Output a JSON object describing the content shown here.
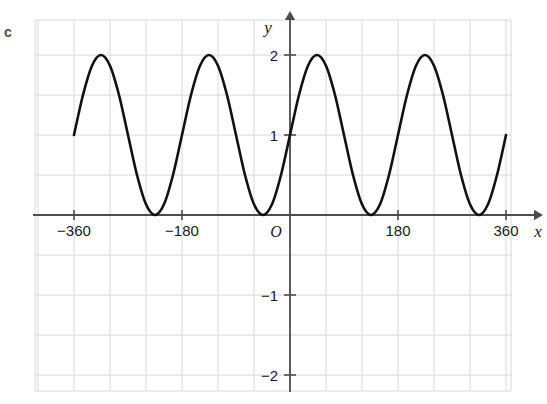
{
  "part_label": "c",
  "chart_data": {
    "type": "line",
    "title": "",
    "subtitle": "",
    "xlabel": "x",
    "ylabel": "y",
    "origin_label": "O",
    "equation": "y = 1 + sin(2x)",
    "grid": true,
    "legend": "none",
    "xlim": [
      -396,
      396
    ],
    "ylim": [
      -2.6,
      2.45
    ],
    "x_unit": "degrees",
    "x_ticks": [
      -360,
      -180,
      180,
      360
    ],
    "x_tick_labels": [
      "−360",
      "−180",
      "180",
      "360"
    ],
    "y_ticks": [
      2,
      1,
      -1,
      -2
    ],
    "y_tick_labels": [
      "2",
      "1",
      "−1",
      "−2"
    ],
    "x_gridline_step": 60,
    "y_gridline_step": 0.5,
    "amplitude": 1,
    "vertical_shift": 1,
    "period": 180,
    "x_domain_drawn": [
      -360,
      360
    ],
    "maxima_x": [
      -315,
      -135,
      45,
      225
    ],
    "maxima_y": 2,
    "minima_x": [
      -225,
      -45,
      135,
      315
    ],
    "minima_y": 0,
    "endpoint_values": [
      {
        "x": -360,
        "y": 1
      },
      {
        "x": 360,
        "y": 1
      }
    ],
    "points": [
      {
        "x": -360,
        "y": 1.0
      },
      {
        "x": -345,
        "y": 1.5
      },
      {
        "x": -330,
        "y": 1.866
      },
      {
        "x": -315,
        "y": 2.0
      },
      {
        "x": -300,
        "y": 1.866
      },
      {
        "x": -285,
        "y": 1.5
      },
      {
        "x": -270,
        "y": 1.0
      },
      {
        "x": -255,
        "y": 0.5
      },
      {
        "x": -240,
        "y": 0.134
      },
      {
        "x": -225,
        "y": 0.0
      },
      {
        "x": -210,
        "y": 0.134
      },
      {
        "x": -195,
        "y": 0.5
      },
      {
        "x": -180,
        "y": 1.0
      },
      {
        "x": -165,
        "y": 1.5
      },
      {
        "x": -150,
        "y": 1.866
      },
      {
        "x": -135,
        "y": 2.0
      },
      {
        "x": -120,
        "y": 1.866
      },
      {
        "x": -105,
        "y": 1.5
      },
      {
        "x": -90,
        "y": 1.0
      },
      {
        "x": -75,
        "y": 0.5
      },
      {
        "x": -60,
        "y": 0.134
      },
      {
        "x": -45,
        "y": 0.0
      },
      {
        "x": -30,
        "y": 0.134
      },
      {
        "x": -15,
        "y": 0.5
      },
      {
        "x": 0,
        "y": 1.0
      },
      {
        "x": 15,
        "y": 1.5
      },
      {
        "x": 30,
        "y": 1.866
      },
      {
        "x": 45,
        "y": 2.0
      },
      {
        "x": 60,
        "y": 1.866
      },
      {
        "x": 75,
        "y": 1.5
      },
      {
        "x": 90,
        "y": 1.0
      },
      {
        "x": 105,
        "y": 0.5
      },
      {
        "x": 120,
        "y": 0.134
      },
      {
        "x": 135,
        "y": 0.0
      },
      {
        "x": 150,
        "y": 0.134
      },
      {
        "x": 165,
        "y": 0.5
      },
      {
        "x": 180,
        "y": 1.0
      },
      {
        "x": 195,
        "y": 1.5
      },
      {
        "x": 210,
        "y": 1.866
      },
      {
        "x": 225,
        "y": 2.0
      },
      {
        "x": 240,
        "y": 1.866
      },
      {
        "x": 255,
        "y": 1.5
      },
      {
        "x": 270,
        "y": 1.0
      },
      {
        "x": 285,
        "y": 0.5
      },
      {
        "x": 300,
        "y": 0.134
      },
      {
        "x": 315,
        "y": 0.0
      },
      {
        "x": 330,
        "y": 0.134
      },
      {
        "x": 345,
        "y": 0.5
      },
      {
        "x": 360,
        "y": 1.0
      }
    ]
  },
  "colors": {
    "curve": "#111111",
    "axis": "#4d4d4d",
    "grid": "#d8d8d8",
    "text": "#1a1a1a",
    "part_label": "#4d4d4d",
    "background": "#ffffff"
  }
}
